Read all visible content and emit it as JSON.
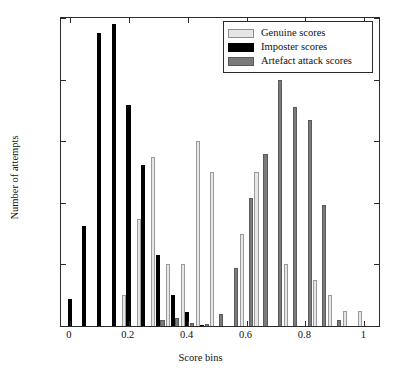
{
  "chart_data": {
    "type": "bar",
    "subtype": "grouped-histogram",
    "title": "",
    "xlabel": "Score bins",
    "ylabel": "Number of attempts",
    "xlim": [
      -0.03,
      1.05
    ],
    "ylim": [
      0,
      0.25
    ],
    "xticks": [
      0,
      0.2,
      0.4,
      0.6,
      0.8,
      1
    ],
    "xticklabels": [
      "0",
      "0.2",
      "0.4",
      "0.6",
      "0.8",
      "1"
    ],
    "yticks": [
      0,
      0.05,
      0.1,
      0.15,
      0.2,
      0.25
    ],
    "yticklabels": [
      "0",
      "0.05",
      "0.1",
      "0.15",
      "0.2",
      "0.25"
    ],
    "grid": false,
    "legend_position": "top-right",
    "bin_width": 0.05,
    "x": [
      0.0,
      0.05,
      0.1,
      0.15,
      0.2,
      0.25,
      0.3,
      0.35,
      0.4,
      0.45,
      0.5,
      0.55,
      0.6,
      0.65,
      0.7,
      0.75,
      0.8,
      0.85,
      0.9,
      0.95,
      1.0
    ],
    "series": [
      {
        "name": "Genuine scores",
        "color": "#e6e6e6",
        "edge_color": "#9a9a9a",
        "values": [
          0,
          0,
          0,
          0,
          0.025,
          0.087,
          0.137,
          0.05,
          0.05,
          0.15,
          0.125,
          0,
          0.075,
          0.125,
          0,
          0.05,
          0,
          0.037,
          0.025,
          0.0125,
          0.0125
        ]
      },
      {
        "name": "Imposter scores",
        "color": "#000000",
        "edge_color": "#000000",
        "values": [
          0.022,
          0.081,
          0.238,
          0.245,
          0.179,
          0.131,
          0.058,
          0.025,
          0.011,
          0.001,
          0,
          0,
          0,
          0,
          0,
          0,
          0,
          0,
          0,
          0,
          0
        ]
      },
      {
        "name": "Artefact attack scores",
        "color": "#7a7a7a",
        "edge_color": "#5a5a5a",
        "values": [
          0,
          0,
          0,
          0,
          0,
          0,
          0.0045,
          0.0065,
          0.0025,
          0.002,
          0.0095,
          0.047,
          0.104,
          0.14,
          0.2,
          0.178,
          0.167,
          0.098,
          0.0045,
          0,
          0
        ]
      }
    ]
  },
  "legend": {
    "items": [
      {
        "label": "Genuine scores",
        "key": "genuine"
      },
      {
        "label": "Imposter scores",
        "key": "imposter"
      },
      {
        "label": "Artefact attack scores",
        "key": "artefact"
      }
    ]
  }
}
